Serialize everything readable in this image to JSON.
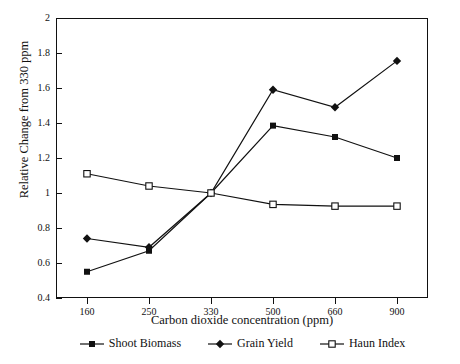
{
  "chart_data": {
    "type": "line",
    "title": "",
    "xlabel": "Carbon dioxide concentration (ppm)",
    "ylabel": "Relative Change from 330 ppm",
    "categories": [
      "160",
      "250",
      "330",
      "500",
      "660",
      "900"
    ],
    "xtick_labels": [
      "160",
      "250",
      "330",
      "500",
      "660",
      "900"
    ],
    "ytick_labels": [
      "0.4",
      "0.6",
      "0.8",
      "1",
      "1.2",
      "1.4",
      "1.6",
      "1.8",
      "2"
    ],
    "ylim": [
      0.4,
      2.0
    ],
    "ytick_step": 0.2,
    "grid": false,
    "legend_position": "bottom",
    "series": [
      {
        "name": "Shoot Biomass",
        "marker": "filled-square",
        "color": "#111111",
        "values": [
          0.55,
          0.67,
          1.0,
          1.385,
          1.32,
          1.2
        ]
      },
      {
        "name": "Grain Yield",
        "marker": "filled-diamond",
        "color": "#111111",
        "values": [
          0.74,
          0.69,
          1.0,
          1.59,
          1.49,
          1.755
        ]
      },
      {
        "name": "Haun Index",
        "marker": "open-square",
        "color": "#111111",
        "values": [
          1.11,
          1.04,
          1.0,
          0.935,
          0.925,
          0.925
        ]
      }
    ]
  },
  "legend": {
    "items": [
      {
        "label": "Shoot Biomass",
        "marker": "filled-square"
      },
      {
        "label": "Grain Yield",
        "marker": "filled-diamond"
      },
      {
        "label": "Haun Index",
        "marker": "open-square"
      }
    ]
  },
  "axes": {
    "y_title": "Relative Change from 330 ppm",
    "x_title": "Carbon dioxide concentration (ppm)"
  }
}
